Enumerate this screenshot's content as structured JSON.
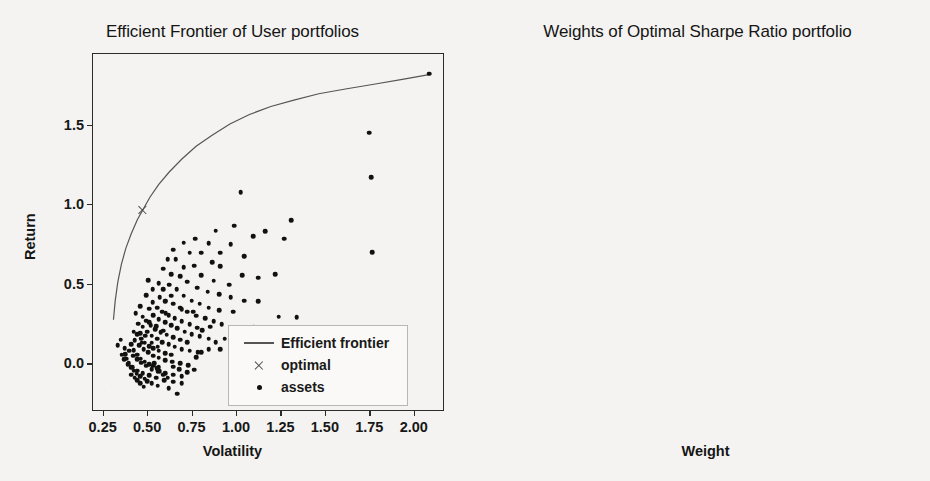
{
  "figure": {
    "background_color": "#f4f3f1",
    "bar_color": "#5e5e5e",
    "line_color": "#555555",
    "marker_color": "#111111"
  },
  "chart_data": [
    {
      "type": "scatter",
      "title": "Efficient Frontier of User portfolios",
      "xlabel": "Volatility",
      "ylabel": "Return",
      "xlim": [
        0.19,
        2.17
      ],
      "ylim": [
        -0.3,
        1.95
      ],
      "grid": false,
      "legend_position": "lower right",
      "legend": [
        "Efficient frontier",
        "optimal",
        "assets"
      ],
      "xticks": [
        "0.25",
        "0.50",
        "0.75",
        "1.00",
        "1.25",
        "1.50",
        "1.75",
        "2.00"
      ],
      "xtick_values": [
        0.25,
        0.5,
        0.75,
        1.0,
        1.25,
        1.5,
        1.75,
        2.0
      ],
      "yticks": [
        "0.0",
        "0.5",
        "1.0",
        "1.5"
      ],
      "ytick_values": [
        0.0,
        0.5,
        1.0,
        1.5
      ],
      "series": [
        {
          "name": "Efficient frontier",
          "type": "line",
          "points": [
            [
              0.305,
              0.28
            ],
            [
              0.315,
              0.4
            ],
            [
              0.33,
              0.52
            ],
            [
              0.35,
              0.63
            ],
            [
              0.375,
              0.73
            ],
            [
              0.405,
              0.82
            ],
            [
              0.44,
              0.91
            ],
            [
              0.47,
              0.97
            ],
            [
              0.51,
              1.05
            ],
            [
              0.56,
              1.13
            ],
            [
              0.62,
              1.21
            ],
            [
              0.69,
              1.29
            ],
            [
              0.77,
              1.37
            ],
            [
              0.86,
              1.44
            ],
            [
              0.96,
              1.51
            ],
            [
              1.07,
              1.57
            ],
            [
              1.19,
              1.62
            ],
            [
              1.32,
              1.66
            ],
            [
              1.46,
              1.7
            ],
            [
              1.61,
              1.73
            ],
            [
              1.77,
              1.76
            ],
            [
              1.93,
              1.79
            ],
            [
              2.08,
              1.82
            ]
          ]
        },
        {
          "name": "optimal",
          "type": "marker",
          "points": [
            [
              0.47,
              0.97
            ]
          ]
        },
        {
          "name": "assets",
          "type": "scatter",
          "points": [
            [
              2.08,
              1.825
            ],
            [
              1.745,
              1.455
            ],
            [
              1.755,
              1.175
            ],
            [
              1.76,
              0.705
            ],
            [
              1.02,
              1.08
            ],
            [
              1.305,
              0.905
            ],
            [
              1.16,
              0.835
            ],
            [
              1.265,
              0.79
            ],
            [
              1.09,
              0.805
            ],
            [
              0.985,
              0.87
            ],
            [
              0.88,
              0.84
            ],
            [
              0.965,
              0.755
            ],
            [
              0.905,
              0.7
            ],
            [
              1.04,
              0.68
            ],
            [
              0.84,
              0.76
            ],
            [
              0.765,
              0.79
            ],
            [
              0.7,
              0.765
            ],
            [
              0.735,
              0.7
            ],
            [
              0.8,
              0.7
            ],
            [
              0.86,
              0.64
            ],
            [
              0.905,
              0.615
            ],
            [
              1.03,
              0.56
            ],
            [
              1.12,
              0.545
            ],
            [
              1.215,
              0.565
            ],
            [
              0.955,
              0.5
            ],
            [
              0.87,
              0.525
            ],
            [
              0.8,
              0.56
            ],
            [
              0.76,
              0.62
            ],
            [
              0.7,
              0.61
            ],
            [
              0.655,
              0.66
            ],
            [
              0.64,
              0.72
            ],
            [
              0.61,
              0.66
            ],
            [
              0.585,
              0.6
            ],
            [
              0.63,
              0.565
            ],
            [
              0.68,
              0.555
            ],
            [
              0.72,
              0.52
            ],
            [
              0.775,
              0.48
            ],
            [
              0.835,
              0.455
            ],
            [
              0.9,
              0.44
            ],
            [
              0.965,
              0.42
            ],
            [
              1.04,
              0.4
            ],
            [
              1.12,
              0.395
            ],
            [
              1.235,
              0.3
            ],
            [
              1.335,
              0.295
            ],
            [
              0.98,
              0.33
            ],
            [
              0.9,
              0.34
            ],
            [
              0.84,
              0.355
            ],
            [
              0.79,
              0.38
            ],
            [
              0.745,
              0.4
            ],
            [
              0.7,
              0.43
            ],
            [
              0.66,
              0.47
            ],
            [
              0.62,
              0.5
            ],
            [
              0.585,
              0.47
            ],
            [
              0.565,
              0.42
            ],
            [
              0.6,
              0.4
            ],
            [
              0.64,
              0.38
            ],
            [
              0.68,
              0.355
            ],
            [
              0.72,
              0.33
            ],
            [
              0.77,
              0.305
            ],
            [
              0.82,
              0.29
            ],
            [
              0.87,
              0.27
            ],
            [
              0.915,
              0.25
            ],
            [
              0.775,
              0.23
            ],
            [
              0.735,
              0.25
            ],
            [
              0.69,
              0.27
            ],
            [
              0.65,
              0.29
            ],
            [
              0.615,
              0.31
            ],
            [
              0.58,
              0.33
            ],
            [
              0.55,
              0.355
            ],
            [
              0.525,
              0.39
            ],
            [
              0.505,
              0.35
            ],
            [
              0.53,
              0.31
            ],
            [
              0.56,
              0.285
            ],
            [
              0.595,
              0.265
            ],
            [
              0.63,
              0.245
            ],
            [
              0.665,
              0.225
            ],
            [
              0.705,
              0.205
            ],
            [
              0.745,
              0.19
            ],
            [
              0.79,
              0.175
            ],
            [
              0.84,
              0.16
            ],
            [
              0.72,
              0.14
            ],
            [
              0.68,
              0.155
            ],
            [
              0.64,
              0.17
            ],
            [
              0.605,
              0.185
            ],
            [
              0.57,
              0.2
            ],
            [
              0.54,
              0.22
            ],
            [
              0.515,
              0.245
            ],
            [
              0.49,
              0.275
            ],
            [
              0.47,
              0.235
            ],
            [
              0.495,
              0.205
            ],
            [
              0.52,
              0.18
            ],
            [
              0.55,
              0.16
            ],
            [
              0.58,
              0.14
            ],
            [
              0.615,
              0.125
            ],
            [
              0.65,
              0.11
            ],
            [
              0.69,
              0.095
            ],
            [
              0.735,
              0.085
            ],
            [
              0.78,
              0.075
            ],
            [
              0.63,
              0.06
            ],
            [
              0.595,
              0.07
            ],
            [
              0.56,
              0.085
            ],
            [
              0.53,
              0.1
            ],
            [
              0.505,
              0.115
            ],
            [
              0.48,
              0.135
            ],
            [
              0.46,
              0.16
            ],
            [
              0.44,
              0.19
            ],
            [
              0.425,
              0.15
            ],
            [
              0.45,
              0.12
            ],
            [
              0.475,
              0.095
            ],
            [
              0.5,
              0.075
            ],
            [
              0.53,
              0.055
            ],
            [
              0.56,
              0.04
            ],
            [
              0.595,
              0.025
            ],
            [
              0.635,
              0.015
            ],
            [
              0.68,
              0.005
            ],
            [
              0.725,
              -0.005
            ],
            [
              0.56,
              -0.02
            ],
            [
              0.53,
              -0.01
            ],
            [
              0.505,
              0.0
            ],
            [
              0.48,
              0.015
            ],
            [
              0.458,
              0.035
            ],
            [
              0.438,
              0.06
            ],
            [
              0.42,
              0.09
            ],
            [
              0.405,
              0.125
            ],
            [
              0.395,
              0.085
            ],
            [
              0.415,
              0.055
            ],
            [
              0.438,
              0.03
            ],
            [
              0.462,
              0.01
            ],
            [
              0.49,
              -0.01
            ],
            [
              0.52,
              -0.03
            ],
            [
              0.555,
              -0.045
            ],
            [
              0.595,
              -0.055
            ],
            [
              0.64,
              -0.065
            ],
            [
              0.69,
              -0.075
            ],
            [
              0.48,
              -0.09
            ],
            [
              0.455,
              -0.075
            ],
            [
              0.435,
              -0.06
            ],
            [
              0.418,
              -0.04
            ],
            [
              0.402,
              -0.02
            ],
            [
              0.39,
              0.005
            ],
            [
              0.38,
              0.035
            ],
            [
              0.372,
              0.065
            ],
            [
              0.368,
              0.1
            ],
            [
              0.352,
              0.06
            ],
            [
              0.365,
              0.03
            ],
            [
              0.385,
              0.0
            ],
            [
              0.41,
              -0.02
            ],
            [
              0.44,
              -0.04
            ],
            [
              0.47,
              -0.055
            ],
            [
              0.505,
              -0.07
            ],
            [
              0.545,
              -0.085
            ],
            [
              0.59,
              -0.1
            ],
            [
              0.64,
              -0.11
            ],
            [
              0.69,
              -0.12
            ],
            [
              0.615,
              -0.15
            ],
            [
              0.665,
              -0.185
            ],
            [
              0.555,
              -0.135
            ],
            [
              0.52,
              -0.12
            ],
            [
              0.495,
              -0.105
            ],
            [
              0.475,
              -0.14
            ],
            [
              0.455,
              -0.12
            ],
            [
              0.44,
              -0.1
            ],
            [
              0.425,
              -0.085
            ],
            [
              0.405,
              -0.065
            ],
            [
              0.33,
              0.12
            ],
            [
              0.345,
              0.155
            ],
            [
              0.42,
              0.205
            ],
            [
              0.455,
              0.195
            ],
            [
              0.52,
              0.135
            ],
            [
              0.555,
              0.11
            ],
            [
              0.6,
              0.32
            ],
            [
              0.49,
              0.435
            ],
            [
              0.525,
              0.47
            ],
            [
              0.56,
              0.51
            ],
            [
              0.5,
              0.53
            ],
            [
              0.47,
              0.3
            ],
            [
              0.445,
              0.255
            ],
            [
              0.77,
              0.045
            ],
            [
              0.8,
              0.075
            ],
            [
              0.84,
              0.095
            ],
            [
              0.88,
              0.14
            ],
            [
              0.93,
              0.16
            ],
            [
              0.985,
              0.19
            ],
            [
              1.035,
              0.215
            ],
            [
              1.095,
              0.235
            ],
            [
              0.61,
              -0.085
            ],
            [
              0.585,
              -0.065
            ],
            [
              0.565,
              -0.045
            ],
            [
              0.548,
              -0.025
            ],
            [
              0.535,
              0.005
            ],
            [
              0.585,
              0.21
            ],
            [
              0.545,
              0.24
            ],
            [
              0.505,
              0.265
            ],
            [
              0.465,
              0.135
            ],
            [
              0.485,
              0.18
            ],
            [
              0.43,
              0.32
            ],
            [
              0.455,
              0.365
            ],
            [
              0.63,
              0.43
            ],
            [
              0.595,
              0.395
            ],
            [
              0.69,
              0.345
            ],
            [
              0.755,
              0.33
            ],
            [
              0.805,
              0.215
            ],
            [
              0.85,
              0.235
            ],
            [
              0.905,
              0.095
            ],
            [
              0.76,
              -0.035
            ],
            [
              0.72,
              -0.05
            ],
            [
              0.675,
              -0.03
            ],
            [
              0.64,
              -0.015
            ]
          ]
        }
      ]
    },
    {
      "type": "bar",
      "orientation": "horizontal",
      "title": "Weights of Optimal Sharpe Ratio portfolio",
      "xlabel": "Weight",
      "ylabel": "",
      "xlim": [
        -0.004,
        0.178
      ],
      "grid": false,
      "xticks": [
        "0.000",
        "0.025",
        "0.050",
        "0.075",
        "0.100",
        "0.125",
        "0.150"
      ],
      "xtick_values": [
        0.0,
        0.025,
        0.05,
        0.075,
        0.1,
        0.125,
        0.15
      ],
      "categories": [
        "1",
        "2",
        "3",
        "4",
        "5",
        "6",
        "7",
        "8",
        "9",
        "10",
        "11",
        "12",
        "13"
      ],
      "values": [
        0.1675,
        0.1665,
        0.1505,
        0.132,
        0.1225,
        0.07,
        0.0595,
        0.0495,
        0.0495,
        0.0365,
        0.0195,
        0.0035,
        0.0025
      ],
      "bar_color": "#5e5e5e"
    }
  ]
}
